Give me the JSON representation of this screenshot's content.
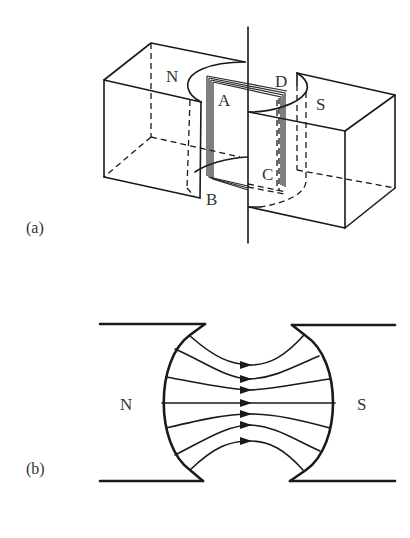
{
  "figure_a": {
    "label": "(a)",
    "pole_left": "N",
    "pole_right": "S",
    "coil_corners": {
      "a": "A",
      "b": "B",
      "c": "C",
      "d": "D"
    }
  },
  "figure_b": {
    "label": "(b)",
    "pole_left": "N",
    "pole_right": "S",
    "field_line_count": 7
  },
  "caption": ""
}
